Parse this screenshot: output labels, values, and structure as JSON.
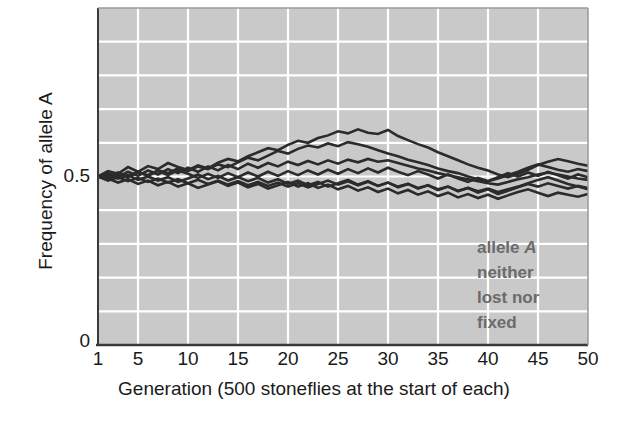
{
  "chart_data": {
    "type": "line",
    "title": "",
    "xlabel": "Generation (500 stoneflies at the start of each)",
    "ylabel": "Frequency of allele A",
    "xlim": [
      1,
      50
    ],
    "ylim": [
      0,
      1
    ],
    "xticks": [
      1,
      5,
      10,
      15,
      20,
      25,
      30,
      35,
      40,
      45,
      50
    ],
    "xtick_labels": [
      "1",
      "5",
      "10",
      "15",
      "20",
      "25",
      "30",
      "35",
      "40",
      "45",
      "50"
    ],
    "yticks": [
      0,
      0.5
    ],
    "ytick_labels": [
      "0",
      "0.5"
    ],
    "grid": true,
    "grid_color": "#ffffff",
    "grid_y_step": 0.1,
    "grid_x_step": 5,
    "plot_background": "#c9c9c9",
    "line_color": "#2b2b2b",
    "legend": "none",
    "annotation": {
      "lines": [
        "allele A",
        "neither",
        "lost nor",
        "fixed"
      ],
      "emphasis_word": "A",
      "color": "#6b6b6b",
      "x": 40,
      "y": 0.3
    },
    "series": [
      {
        "name": "population-1",
        "values": [
          0.5,
          0.516,
          0.508,
          0.528,
          0.514,
          0.531,
          0.522,
          0.54,
          0.528,
          0.519,
          0.533,
          0.524,
          0.541,
          0.552,
          0.545,
          0.56,
          0.572,
          0.584,
          0.578,
          0.594,
          0.606,
          0.6,
          0.614,
          0.622,
          0.634,
          0.628,
          0.64,
          0.63,
          0.626,
          0.638,
          0.62,
          0.608,
          0.596,
          0.586,
          0.572,
          0.56,
          0.548,
          0.536,
          0.526,
          0.518,
          0.506,
          0.498,
          0.508,
          0.52,
          0.534,
          0.544,
          0.552,
          0.545,
          0.538,
          0.532
        ]
      },
      {
        "name": "population-2",
        "values": [
          0.5,
          0.492,
          0.506,
          0.498,
          0.512,
          0.504,
          0.518,
          0.51,
          0.524,
          0.516,
          0.53,
          0.522,
          0.536,
          0.528,
          0.542,
          0.556,
          0.548,
          0.562,
          0.576,
          0.568,
          0.582,
          0.592,
          0.586,
          0.598,
          0.59,
          0.602,
          0.596,
          0.588,
          0.578,
          0.568,
          0.56,
          0.55,
          0.542,
          0.534,
          0.524,
          0.516,
          0.51,
          0.5,
          0.492,
          0.486,
          0.494,
          0.504,
          0.514,
          0.526,
          0.536,
          0.528,
          0.52,
          0.514,
          0.522,
          0.516
        ]
      },
      {
        "name": "population-3",
        "values": [
          0.5,
          0.51,
          0.498,
          0.514,
          0.502,
          0.518,
          0.506,
          0.522,
          0.51,
          0.526,
          0.514,
          0.53,
          0.518,
          0.534,
          0.522,
          0.538,
          0.526,
          0.54,
          0.53,
          0.544,
          0.534,
          0.546,
          0.536,
          0.548,
          0.538,
          0.55,
          0.542,
          0.552,
          0.544,
          0.548,
          0.54,
          0.532,
          0.524,
          0.518,
          0.51,
          0.504,
          0.498,
          0.492,
          0.486,
          0.48,
          0.476,
          0.484,
          0.492,
          0.498,
          0.506,
          0.512,
          0.506,
          0.5,
          0.494,
          0.49
        ]
      },
      {
        "name": "population-4",
        "values": [
          0.5,
          0.488,
          0.498,
          0.486,
          0.496,
          0.484,
          0.494,
          0.482,
          0.492,
          0.48,
          0.49,
          0.478,
          0.488,
          0.476,
          0.486,
          0.474,
          0.484,
          0.472,
          0.482,
          0.47,
          0.48,
          0.468,
          0.478,
          0.488,
          0.476,
          0.486,
          0.474,
          0.484,
          0.472,
          0.482,
          0.47,
          0.478,
          0.466,
          0.474,
          0.462,
          0.47,
          0.458,
          0.466,
          0.456,
          0.464,
          0.454,
          0.462,
          0.47,
          0.48,
          0.49,
          0.498,
          0.488,
          0.478,
          0.47,
          0.462
        ]
      },
      {
        "name": "population-5",
        "values": [
          0.5,
          0.494,
          0.482,
          0.492,
          0.478,
          0.488,
          0.474,
          0.484,
          0.47,
          0.48,
          0.466,
          0.476,
          0.486,
          0.472,
          0.482,
          0.468,
          0.478,
          0.464,
          0.474,
          0.484,
          0.47,
          0.48,
          0.466,
          0.476,
          0.462,
          0.472,
          0.458,
          0.468,
          0.454,
          0.464,
          0.45,
          0.46,
          0.446,
          0.456,
          0.442,
          0.452,
          0.438,
          0.448,
          0.436,
          0.446,
          0.434,
          0.444,
          0.454,
          0.462,
          0.452,
          0.442,
          0.452,
          0.446,
          0.44,
          0.448
        ]
      },
      {
        "name": "population-6",
        "values": [
          0.5,
          0.506,
          0.494,
          0.504,
          0.49,
          0.5,
          0.488,
          0.498,
          0.484,
          0.494,
          0.506,
          0.492,
          0.502,
          0.488,
          0.498,
          0.486,
          0.496,
          0.482,
          0.492,
          0.478,
          0.488,
          0.474,
          0.484,
          0.47,
          0.48,
          0.49,
          0.476,
          0.486,
          0.472,
          0.482,
          0.468,
          0.478,
          0.464,
          0.474,
          0.46,
          0.47,
          0.456,
          0.466,
          0.452,
          0.462,
          0.448,
          0.458,
          0.468,
          0.478,
          0.47,
          0.48,
          0.472,
          0.464,
          0.472,
          0.466
        ]
      },
      {
        "name": "population-7",
        "values": [
          0.5,
          0.498,
          0.512,
          0.5,
          0.514,
          0.502,
          0.516,
          0.504,
          0.518,
          0.508,
          0.496,
          0.508,
          0.496,
          0.51,
          0.498,
          0.512,
          0.5,
          0.514,
          0.502,
          0.516,
          0.504,
          0.518,
          0.506,
          0.52,
          0.508,
          0.522,
          0.51,
          0.524,
          0.512,
          0.526,
          0.514,
          0.504,
          0.516,
          0.506,
          0.494,
          0.506,
          0.494,
          0.484,
          0.496,
          0.486,
          0.498,
          0.51,
          0.5,
          0.512,
          0.502,
          0.514,
          0.504,
          0.494,
          0.506,
          0.498
        ]
      }
    ]
  },
  "layout": {
    "plot_left": 98,
    "plot_top": 8,
    "plot_right": 588,
    "plot_bottom": 345
  }
}
